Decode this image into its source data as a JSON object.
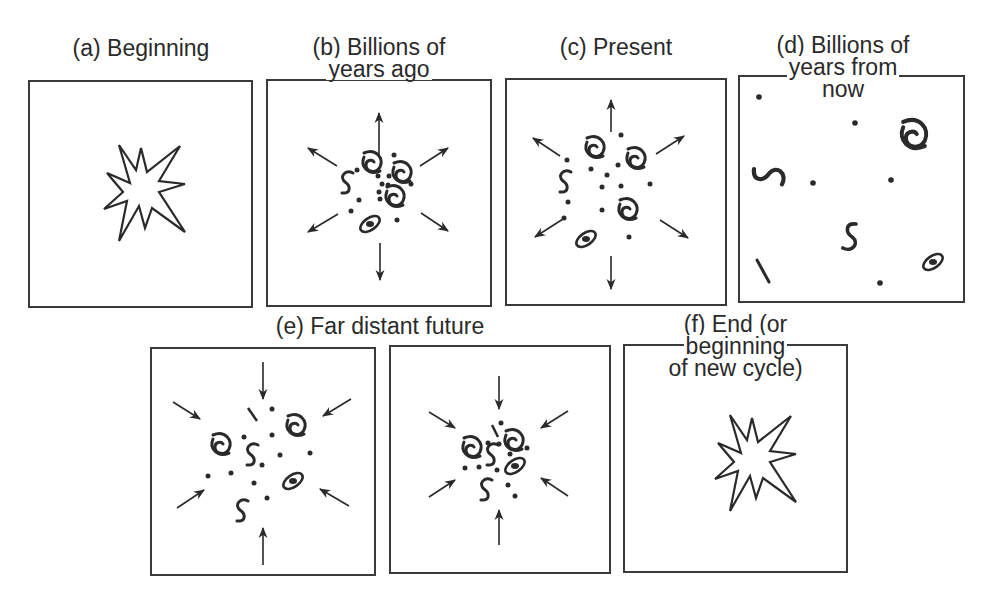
{
  "figure": {
    "panels": [
      {
        "id": "a",
        "label_lines": [
          "(a) Beginning"
        ],
        "content": "explosion-burst",
        "motion": "none"
      },
      {
        "id": "b",
        "label_lines": [
          "(b) Billions of",
          "years ago"
        ],
        "content": "dense galaxy cluster",
        "motion": "expanding"
      },
      {
        "id": "c",
        "label_lines": [
          "(c) Present"
        ],
        "content": "galaxies spreading",
        "motion": "expanding"
      },
      {
        "id": "d",
        "label_lines": [
          "(d) Billions of",
          "years from",
          "now"
        ],
        "content": "widely scattered galaxies",
        "motion": "none"
      },
      {
        "id": "e",
        "label_lines": [
          "(e) Far distant future"
        ],
        "content": "galaxies contracting (two frames)",
        "motion": "contracting"
      },
      {
        "id": "f",
        "label_lines": [
          "(f) End (or",
          "beginning",
          "of new cycle)"
        ],
        "content": "explosion-burst",
        "motion": "none"
      }
    ]
  },
  "colors": {
    "ink": "#2a2a2a",
    "background": "#ffffff"
  }
}
